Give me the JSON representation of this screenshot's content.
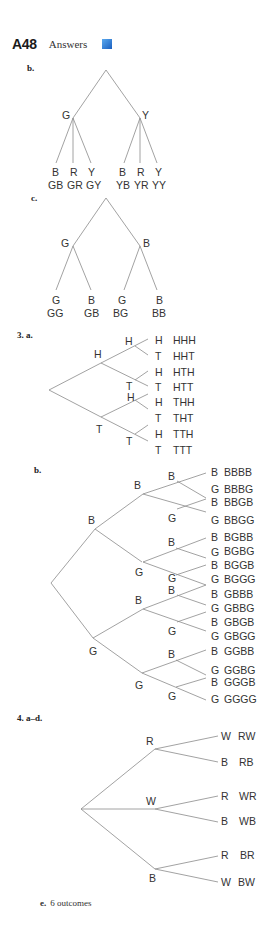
{
  "header": {
    "page_number": "A48",
    "section": "Answers",
    "accent_color": "#2a78d6"
  },
  "problem2": {
    "part_b": {
      "label": "b.",
      "first_level": [
        "G",
        "Y"
      ],
      "second_level": {
        "G": [
          "B",
          "R",
          "Y"
        ],
        "Y": [
          "B",
          "R",
          "Y"
        ]
      },
      "outcomes": [
        "GB",
        "GR",
        "GY",
        "YB",
        "YR",
        "YY"
      ]
    },
    "part_c": {
      "label": "c.",
      "first_level": [
        "G",
        "B"
      ],
      "second_level": {
        "G": [
          "G",
          "B"
        ],
        "B": [
          "G",
          "B"
        ]
      },
      "outcomes": [
        "GG",
        "GB",
        "BG",
        "BB"
      ]
    }
  },
  "problem3": {
    "number_label": "3. a.",
    "part_a": {
      "first_level": [
        "H",
        "T"
      ],
      "second_level": [
        "H",
        "T",
        "H",
        "T"
      ],
      "leaves": [
        {
          "branch": "H",
          "outcome": "HHH"
        },
        {
          "branch": "T",
          "outcome": "HHT"
        },
        {
          "branch": "H",
          "outcome": "HTH"
        },
        {
          "branch": "T",
          "outcome": "HTT"
        },
        {
          "branch": "H",
          "outcome": "THH"
        },
        {
          "branch": "T",
          "outcome": "THT"
        },
        {
          "branch": "H",
          "outcome": "TTH"
        },
        {
          "branch": "T",
          "outcome": "TTT"
        }
      ]
    },
    "part_b": {
      "label": "b.",
      "first_level": [
        "B",
        "G"
      ],
      "second_level": [
        "B",
        "G",
        "B",
        "G"
      ],
      "third_level": [
        "B",
        "G",
        "B",
        "G",
        "B",
        "G",
        "B",
        "G"
      ],
      "leaves": [
        {
          "branch": "B",
          "outcome": "BBBB"
        },
        {
          "branch": "G",
          "outcome": "BBBG"
        },
        {
          "branch": "B",
          "outcome": "BBGB"
        },
        {
          "branch": "G",
          "outcome": "BBGG"
        },
        {
          "branch": "B",
          "outcome": "BGBB"
        },
        {
          "branch": "G",
          "outcome": "BGBG"
        },
        {
          "branch": "B",
          "outcome": "BGGB"
        },
        {
          "branch": "G",
          "outcome": "BGGG"
        },
        {
          "branch": "B",
          "outcome": "GBBB"
        },
        {
          "branch": "G",
          "outcome": "GBBG"
        },
        {
          "branch": "B",
          "outcome": "GBGB"
        },
        {
          "branch": "G",
          "outcome": "GBGG"
        },
        {
          "branch": "B",
          "outcome": "GGBB"
        },
        {
          "branch": "G",
          "outcome": "GGBG"
        },
        {
          "branch": "B",
          "outcome": "GGGB"
        },
        {
          "branch": "G",
          "outcome": "GGGG"
        }
      ]
    }
  },
  "problem4": {
    "number_label": "4. a–d.",
    "first_level": [
      "R",
      "W",
      "B"
    ],
    "leaves": [
      {
        "branch": "W",
        "outcome": "RW"
      },
      {
        "branch": "B",
        "outcome": "RB"
      },
      {
        "branch": "R",
        "outcome": "WR"
      },
      {
        "branch": "B",
        "outcome": "WB"
      },
      {
        "branch": "R",
        "outcome": "BR"
      },
      {
        "branch": "W",
        "outcome": "BW"
      }
    ],
    "part_e": {
      "label": "e.",
      "text": "6 outcomes"
    }
  }
}
